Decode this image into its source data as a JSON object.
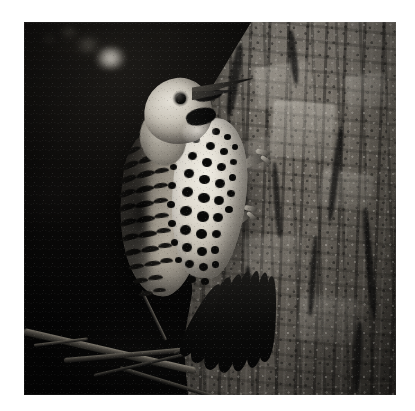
{
  "image": {
    "kind": "photograph",
    "medium": "black-and-white photograph",
    "orientation": "square",
    "canvas": {
      "width": 415,
      "height": 411,
      "background_color": "#ffffff"
    },
    "photo_frame": {
      "left": 24,
      "top": 22,
      "width": 372,
      "height": 373,
      "border": "white margin"
    },
    "caption": "Northern Flicker woodpecker clinging to a tree trunk at night",
    "alt_text": "A black-and-white night photograph of a flicker woodpecker gripping the side of a rough-barked tree trunk, its spotted breast and barred wing clearly lit against a dark background."
  },
  "subjects": {
    "bird": {
      "label": "Northern Flicker (woodpecker)",
      "pose": "clinging vertically to trunk, head turned up and right",
      "parts": [
        {
          "name": "beak",
          "description": "long, straight, pointed dark bill angled up-right"
        },
        {
          "name": "eye",
          "description": "small round dark eye with pale surrounding face"
        },
        {
          "name": "malar-stripe",
          "description": "bold black mustache mark below the eye"
        },
        {
          "name": "head",
          "description": "pale gray-tan crown and face"
        },
        {
          "name": "breast",
          "description": "cream underparts covered in bold round black spots"
        },
        {
          "name": "wing",
          "description": "barred brown-and-black folded wing"
        },
        {
          "name": "tail",
          "description": "long dark stiff tail feathers braced on the bark"
        },
        {
          "name": "foot",
          "description": "pale clawed foot gripping the bark"
        }
      ]
    },
    "tree_trunk": {
      "label": "tree trunk",
      "position": "right side of frame",
      "description": "rough, deeply furrowed bark with pale plate-like patches and dark crevices"
    },
    "branches": {
      "label": "thin twigs",
      "position": "lower left",
      "description": "tangle of slender dimly-lit branches crossing the dark foreground"
    },
    "background": {
      "label": "night background",
      "description": "near-black out-of-focus darkness with a soft bright bokeh highlight at upper left"
    }
  },
  "palette": {
    "paper_white": "#ffffff",
    "shadow_black": "#050505",
    "bark_mid_gray": "#6f6a62",
    "bark_light": "#b8b3aa",
    "plumage_cream": "#efece3",
    "spot_black": "#090908",
    "bokeh_highlight": "#e8e4dc"
  },
  "spots": [
    {
      "x": 176,
      "y": 102,
      "w": 7,
      "h": 6,
      "r": -8
    },
    {
      "x": 188,
      "y": 106,
      "w": 8,
      "h": 7,
      "r": 4
    },
    {
      "x": 200,
      "y": 112,
      "w": 7,
      "h": 6,
      "r": 0
    },
    {
      "x": 168,
      "y": 114,
      "w": 8,
      "h": 7,
      "r": -6
    },
    {
      "x": 182,
      "y": 120,
      "w": 9,
      "h": 8,
      "r": 5
    },
    {
      "x": 196,
      "y": 126,
      "w": 8,
      "h": 7,
      "r": -3
    },
    {
      "x": 208,
      "y": 122,
      "w": 6,
      "h": 6,
      "r": 0
    },
    {
      "x": 164,
      "y": 130,
      "w": 9,
      "h": 8,
      "r": -10
    },
    {
      "x": 178,
      "y": 136,
      "w": 10,
      "h": 9,
      "r": 3
    },
    {
      "x": 193,
      "y": 141,
      "w": 9,
      "h": 8,
      "r": -4
    },
    {
      "x": 206,
      "y": 137,
      "w": 7,
      "h": 6,
      "r": 6
    },
    {
      "x": 160,
      "y": 147,
      "w": 10,
      "h": 9,
      "r": -7
    },
    {
      "x": 175,
      "y": 153,
      "w": 11,
      "h": 9,
      "r": 2
    },
    {
      "x": 191,
      "y": 157,
      "w": 10,
      "h": 9,
      "r": -5
    },
    {
      "x": 205,
      "y": 152,
      "w": 7,
      "h": 7,
      "r": 0
    },
    {
      "x": 158,
      "y": 165,
      "w": 11,
      "h": 10,
      "r": -9
    },
    {
      "x": 174,
      "y": 171,
      "w": 12,
      "h": 10,
      "r": 4
    },
    {
      "x": 190,
      "y": 174,
      "w": 10,
      "h": 9,
      "r": -3
    },
    {
      "x": 203,
      "y": 168,
      "w": 8,
      "h": 7,
      "r": 8
    },
    {
      "x": 156,
      "y": 184,
      "w": 12,
      "h": 10,
      "r": -6
    },
    {
      "x": 173,
      "y": 189,
      "w": 12,
      "h": 11,
      "r": 3
    },
    {
      "x": 189,
      "y": 191,
      "w": 10,
      "h": 9,
      "r": -4
    },
    {
      "x": 201,
      "y": 184,
      "w": 8,
      "h": 7,
      "r": 0
    },
    {
      "x": 156,
      "y": 203,
      "w": 11,
      "h": 10,
      "r": -8
    },
    {
      "x": 172,
      "y": 207,
      "w": 11,
      "h": 10,
      "r": 2
    },
    {
      "x": 188,
      "y": 208,
      "w": 9,
      "h": 8,
      "r": -5
    },
    {
      "x": 158,
      "y": 221,
      "w": 10,
      "h": 9,
      "r": -6
    },
    {
      "x": 173,
      "y": 225,
      "w": 10,
      "h": 9,
      "r": 4
    },
    {
      "x": 187,
      "y": 224,
      "w": 8,
      "h": 8,
      "r": -2
    },
    {
      "x": 161,
      "y": 238,
      "w": 9,
      "h": 8,
      "r": -7
    },
    {
      "x": 175,
      "y": 241,
      "w": 9,
      "h": 8,
      "r": 3
    },
    {
      "x": 188,
      "y": 239,
      "w": 7,
      "h": 7,
      "r": 0
    },
    {
      "x": 164,
      "y": 254,
      "w": 8,
      "h": 7,
      "r": -5
    },
    {
      "x": 177,
      "y": 256,
      "w": 8,
      "h": 7,
      "r": 2
    },
    {
      "x": 148,
      "y": 112,
      "w": 6,
      "h": 6,
      "r": 0
    },
    {
      "x": 152,
      "y": 126,
      "w": 7,
      "h": 6,
      "r": -4
    },
    {
      "x": 146,
      "y": 142,
      "w": 7,
      "h": 6,
      "r": 3
    },
    {
      "x": 144,
      "y": 160,
      "w": 8,
      "h": 7,
      "r": -6
    },
    {
      "x": 143,
      "y": 179,
      "w": 8,
      "h": 7,
      "r": 2
    },
    {
      "x": 144,
      "y": 198,
      "w": 8,
      "h": 7,
      "r": -3
    },
    {
      "x": 147,
      "y": 217,
      "w": 7,
      "h": 7,
      "r": 4
    },
    {
      "x": 151,
      "y": 235,
      "w": 7,
      "h": 6,
      "r": -2
    }
  ],
  "bars": [
    {
      "x": 104,
      "y": 112,
      "w": 16,
      "h": 5,
      "r": -28
    },
    {
      "x": 120,
      "y": 106,
      "w": 17,
      "h": 5,
      "r": -22
    },
    {
      "x": 136,
      "y": 102,
      "w": 14,
      "h": 5,
      "r": -16
    },
    {
      "x": 100,
      "y": 126,
      "w": 17,
      "h": 5,
      "r": -26
    },
    {
      "x": 117,
      "y": 120,
      "w": 18,
      "h": 6,
      "r": -20
    },
    {
      "x": 134,
      "y": 116,
      "w": 14,
      "h": 5,
      "r": -14
    },
    {
      "x": 97,
      "y": 140,
      "w": 18,
      "h": 6,
      "r": -24
    },
    {
      "x": 114,
      "y": 134,
      "w": 19,
      "h": 6,
      "r": -18
    },
    {
      "x": 132,
      "y": 131,
      "w": 14,
      "h": 5,
      "r": -12
    },
    {
      "x": 95,
      "y": 154,
      "w": 18,
      "h": 6,
      "r": -22
    },
    {
      "x": 112,
      "y": 149,
      "w": 19,
      "h": 6,
      "r": -16
    },
    {
      "x": 130,
      "y": 146,
      "w": 15,
      "h": 5,
      "r": -10
    },
    {
      "x": 94,
      "y": 168,
      "w": 18,
      "h": 6,
      "r": -20
    },
    {
      "x": 111,
      "y": 164,
      "w": 19,
      "h": 6,
      "r": -14
    },
    {
      "x": 129,
      "y": 161,
      "w": 15,
      "h": 5,
      "r": -9
    },
    {
      "x": 94,
      "y": 182,
      "w": 18,
      "h": 6,
      "r": -18
    },
    {
      "x": 111,
      "y": 179,
      "w": 19,
      "h": 6,
      "r": -12
    },
    {
      "x": 129,
      "y": 176,
      "w": 15,
      "h": 5,
      "r": -8
    },
    {
      "x": 95,
      "y": 197,
      "w": 18,
      "h": 6,
      "r": -16
    },
    {
      "x": 112,
      "y": 194,
      "w": 19,
      "h": 6,
      "r": -11
    },
    {
      "x": 130,
      "y": 191,
      "w": 15,
      "h": 5,
      "r": -7
    },
    {
      "x": 97,
      "y": 212,
      "w": 18,
      "h": 6,
      "r": -14
    },
    {
      "x": 114,
      "y": 209,
      "w": 19,
      "h": 6,
      "r": -10
    },
    {
      "x": 132,
      "y": 206,
      "w": 15,
      "h": 5,
      "r": -6
    },
    {
      "x": 100,
      "y": 227,
      "w": 17,
      "h": 6,
      "r": -12
    },
    {
      "x": 117,
      "y": 224,
      "w": 18,
      "h": 6,
      "r": -8
    },
    {
      "x": 134,
      "y": 221,
      "w": 14,
      "h": 5,
      "r": -5
    },
    {
      "x": 104,
      "y": 242,
      "w": 16,
      "h": 5,
      "r": -10
    },
    {
      "x": 120,
      "y": 239,
      "w": 17,
      "h": 5,
      "r": -7
    },
    {
      "x": 136,
      "y": 236,
      "w": 13,
      "h": 5,
      "r": -4
    },
    {
      "x": 109,
      "y": 256,
      "w": 15,
      "h": 5,
      "r": -8
    },
    {
      "x": 124,
      "y": 253,
      "w": 15,
      "h": 5,
      "r": -6
    },
    {
      "x": 115,
      "y": 269,
      "w": 14,
      "h": 5,
      "r": -6
    },
    {
      "x": 129,
      "y": 266,
      "w": 13,
      "h": 4,
      "r": -4
    }
  ],
  "tail_feathers": [
    {
      "x": 178,
      "y": 252,
      "w": 20,
      "h": 92,
      "r": 22
    },
    {
      "x": 190,
      "y": 250,
      "w": 20,
      "h": 100,
      "r": 18
    },
    {
      "x": 202,
      "y": 248,
      "w": 19,
      "h": 104,
      "r": 14
    },
    {
      "x": 214,
      "y": 248,
      "w": 18,
      "h": 102,
      "r": 11
    },
    {
      "x": 226,
      "y": 250,
      "w": 17,
      "h": 96,
      "r": 8
    },
    {
      "x": 236,
      "y": 254,
      "w": 16,
      "h": 86,
      "r": 5
    },
    {
      "x": 168,
      "y": 258,
      "w": 18,
      "h": 80,
      "r": 27
    }
  ],
  "legs": [
    {
      "x": 206,
      "y": 136,
      "w": 38,
      "h": 9,
      "r": -22
    },
    {
      "x": 198,
      "y": 196,
      "w": 30,
      "h": 8,
      "r": -38
    },
    {
      "x": 232,
      "y": 128,
      "w": 14,
      "h": 5,
      "r": 14
    },
    {
      "x": 236,
      "y": 136,
      "w": 12,
      "h": 4,
      "r": 36
    },
    {
      "x": 220,
      "y": 184,
      "w": 13,
      "h": 5,
      "r": 10
    },
    {
      "x": 222,
      "y": 192,
      "w": 11,
      "h": 4,
      "r": 40
    }
  ]
}
